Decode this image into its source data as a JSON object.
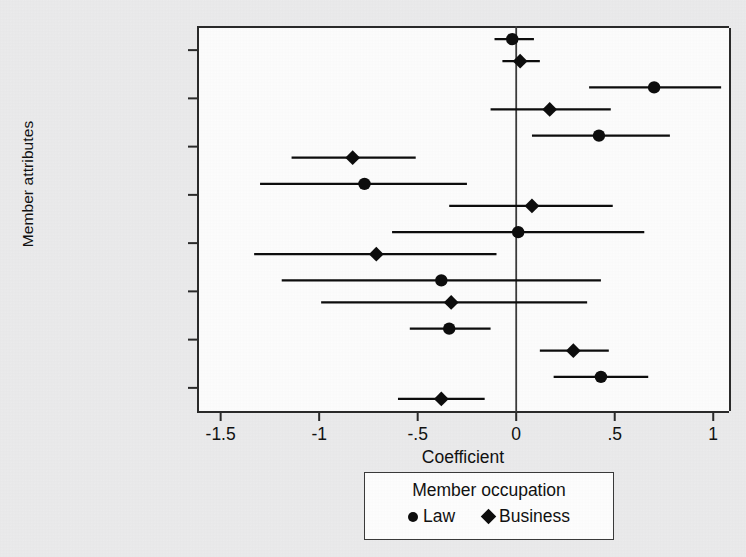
{
  "chart_data": {
    "type": "scatter",
    "subtype": "coefficient-plot-with-confidence-intervals",
    "title": "",
    "xlabel": "Coefficient",
    "ylabel": "Member attributes",
    "xlim": [
      -1.62,
      1.08
    ],
    "xticks": [
      -1.5,
      -1,
      -0.5,
      0,
      0.5,
      1
    ],
    "xtick_labels": [
      "-1.5",
      "-1",
      "-.5",
      "0",
      ".5",
      "1"
    ],
    "grid": false,
    "reference_line_x": 0,
    "legend": {
      "title": "Member occupation",
      "position": "below-axis-center",
      "entries": [
        {
          "name": "Law",
          "marker": "circle"
        },
        {
          "name": "Business",
          "marker": "diamond"
        }
      ]
    },
    "categories": [
      "Urban",
      "Southern",
      "Democrat",
      "Woman",
      "Black",
      "Latino",
      "Age (/10)",
      "Seniority (/10)"
    ],
    "series": [
      {
        "name": "Law",
        "marker": "circle",
        "color": "#0d0d0d",
        "values": [
          -0.02,
          0.7,
          0.42,
          -0.77,
          0.01,
          -0.38,
          -0.34,
          0.43
        ],
        "ci_low": [
          -0.11,
          0.37,
          0.08,
          -1.3,
          -0.63,
          -1.19,
          -0.54,
          0.19
        ],
        "ci_high": [
          0.09,
          1.04,
          0.78,
          -0.25,
          0.65,
          0.43,
          -0.13,
          0.67
        ]
      },
      {
        "name": "Business",
        "marker": "diamond",
        "color": "#0d0d0d",
        "values": [
          0.02,
          0.17,
          -0.83,
          0.08,
          -0.71,
          -0.33,
          0.29,
          -0.38
        ],
        "ci_low": [
          -0.07,
          -0.13,
          -1.14,
          -0.34,
          -1.33,
          -0.99,
          0.12,
          -0.6
        ],
        "ci_high": [
          0.12,
          0.48,
          -0.51,
          0.49,
          -0.1,
          0.36,
          0.47,
          -0.16
        ]
      }
    ]
  }
}
